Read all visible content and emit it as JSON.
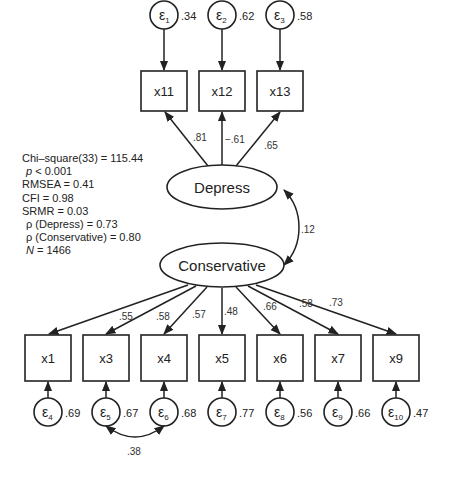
{
  "diagram": {
    "type": "structural-equation-model",
    "latents": [
      {
        "id": "depress",
        "label": "Depress"
      },
      {
        "id": "conservative",
        "label": "Conservative"
      }
    ],
    "top_indicators": [
      {
        "label": "x11",
        "loading": ".81",
        "error": "ε",
        "error_sub": "1",
        "variance": ".34"
      },
      {
        "label": "x12",
        "loading": "−.61",
        "error": "ε",
        "error_sub": "2",
        "variance": ".62"
      },
      {
        "label": "x13",
        "loading": ".65",
        "error": "ε",
        "error_sub": "3",
        "variance": ".58"
      }
    ],
    "bottom_indicators": [
      {
        "label": "x1",
        "loading": "",
        "error": "ε",
        "error_sub": "4",
        "variance": ".69"
      },
      {
        "label": "x3",
        "loading": ".55",
        "error": "ε",
        "error_sub": "5",
        "variance": ".67"
      },
      {
        "label": "x4",
        "loading": ".58",
        "error": "ε",
        "error_sub": "6",
        "variance": ".68"
      },
      {
        "label": "x5",
        "loading": ".57",
        "error": "ε",
        "error_sub": "7",
        "variance": ".77"
      },
      {
        "label": "x6",
        "loading": ".48",
        "error": "ε",
        "error_sub": "8",
        "variance": ".56"
      },
      {
        "label": "x7",
        "loading": ".66",
        "error": "ε",
        "error_sub": "9",
        "variance": ".66"
      },
      {
        "label": "x9",
        "loading": ".58",
        "error": "ε",
        "error_sub": "10",
        "variance": ".47"
      }
    ],
    "extra_loading_label": ".73",
    "latent_covariance": ".12",
    "error_covariance": {
      "between": [
        "ε5",
        "ε6"
      ],
      "value": ".38"
    }
  },
  "fit_stats": {
    "chi_square": "Chi–square(33) = 115.44",
    "p_symbol": "p",
    "p_value": " < 0.001",
    "rmsea": "RMSEA = 0.41",
    "cfi": "CFI = 0.98",
    "srmr": "SRMR = 0.03",
    "rho_depress": "ρ (Depress) = 0.73",
    "rho_conservative": "ρ (Conservative) = 0.80",
    "n_symbol": "N",
    "n_value": " = 1466"
  },
  "colors": {
    "stroke": "#222222",
    "text": "#222222",
    "background": "#ffffff"
  }
}
